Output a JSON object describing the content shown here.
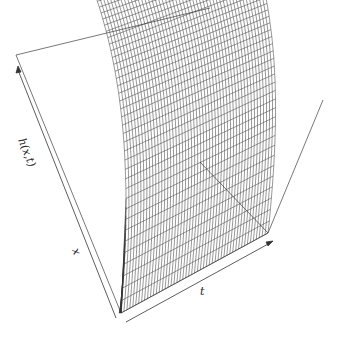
{
  "chart_data": {
    "type": "surface",
    "title": "",
    "xlabel": "x",
    "ylabel": "t",
    "zlabel": "h(x,t)",
    "grid_x_lines": 50,
    "grid_t_lines": 50,
    "ticks": "none",
    "box": true,
    "colors": {
      "line": "#333333",
      "box": "#555555",
      "background": "#ffffff"
    }
  },
  "labels": {
    "z": "h(x,t)",
    "x": "x",
    "t": "t"
  }
}
